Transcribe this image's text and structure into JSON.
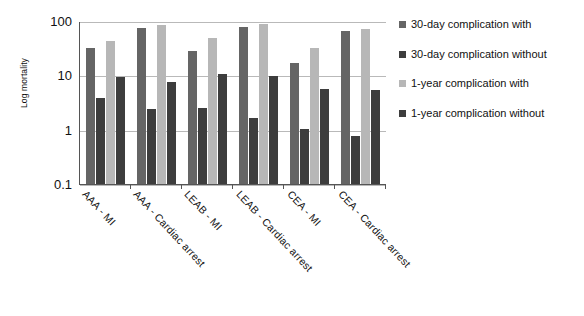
{
  "chart_data": {
    "type": "bar",
    "title": "",
    "xlabel": "",
    "ylabel": "Log mortality",
    "yscale": "log",
    "ylim": [
      0.1,
      100
    ],
    "ytick_labels": [
      "100",
      "10",
      "1",
      "0.1"
    ],
    "ytick_values": [
      100,
      10,
      1,
      0.1
    ],
    "grid": true,
    "legend_position": "right",
    "categories": [
      "AAA - MI",
      "AAA - Cardiac arrest",
      "LEAB - MI",
      "LEAB - Cardiac arrest",
      "CEA - MI",
      "CEA - Cardiac arrest"
    ],
    "series": [
      {
        "name": "30-day complication with",
        "color": "#656565",
        "values": [
          32,
          75,
          28,
          78,
          17,
          65
        ]
      },
      {
        "name": "30-day complication without",
        "color": "#3d3d3d",
        "values": [
          3.8,
          2.4,
          2.5,
          1.65,
          1.05,
          0.78
        ]
      },
      {
        "name": "1-year complication with",
        "color": "#b7b7b7",
        "values": [
          43,
          85,
          48,
          87,
          32,
          70
        ]
      },
      {
        "name": "1-year complication without",
        "color": "#3d3d3d",
        "values": [
          9.2,
          7.5,
          10.5,
          9.8,
          5.7,
          5.4
        ]
      }
    ]
  },
  "legend": {
    "items": [
      {
        "label": "30-day complication with"
      },
      {
        "label": "30-day complication without"
      },
      {
        "label": "1-year complication with"
      },
      {
        "label": "1-year complication without"
      }
    ]
  }
}
